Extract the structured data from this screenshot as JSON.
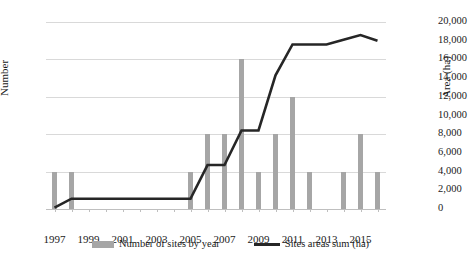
{
  "chart_data": {
    "type": "bar",
    "title": "",
    "subtitle": "",
    "xlabel": "",
    "ylabel": "Number",
    "y2label": "Area (ha)",
    "grid": true,
    "legend_position": "bottom",
    "categories": [
      1997,
      1998,
      1999,
      2000,
      2001,
      2002,
      2003,
      2004,
      2005,
      2006,
      2007,
      2008,
      2009,
      2010,
      2011,
      2012,
      2013,
      2014,
      2015,
      2016
    ],
    "xtick_labels": [
      "1997",
      "1999",
      "2001",
      "2003",
      "2005",
      "2007",
      "2009",
      "2011",
      "2013",
      "2015"
    ],
    "xtick_values": [
      1997,
      1999,
      2001,
      2003,
      2005,
      2007,
      2009,
      2011,
      2013,
      2015
    ],
    "ylim": [
      0,
      5
    ],
    "ytick_labels": [
      "0",
      "1",
      "2",
      "3",
      "4",
      "5"
    ],
    "ytick_values": [
      0,
      1,
      2,
      3,
      4,
      5
    ],
    "y2lim": [
      0,
      20000
    ],
    "y2tick_labels": [
      "0",
      "2,000",
      "4,000",
      "6,000",
      "8,000",
      "10,000",
      "12,000",
      "14,000",
      "16,000",
      "18,000",
      "20,000"
    ],
    "y2tick_values": [
      0,
      2000,
      4000,
      6000,
      8000,
      10000,
      12000,
      14000,
      16000,
      18000,
      20000
    ],
    "series": [
      {
        "name": "Number of sites by year",
        "kind": "bar",
        "axis": "left",
        "color": "#a6a6a6",
        "values": [
          1,
          1,
          0,
          0,
          0,
          0,
          0,
          0,
          1,
          2,
          2,
          4,
          1,
          2,
          3,
          1,
          0,
          1,
          2,
          1
        ]
      },
      {
        "name": "Sites areas sum (ha)",
        "kind": "line",
        "axis": "right",
        "color": "#262626",
        "values": [
          150,
          1100,
          1100,
          1100,
          1100,
          1100,
          1100,
          1100,
          1100,
          4700,
          4700,
          8400,
          8400,
          14300,
          17600,
          17600,
          17600,
          18100,
          18600,
          18000
        ]
      }
    ]
  },
  "legend": {
    "items": [
      {
        "label": "Number of sites by year",
        "swatch": "bar-swatch",
        "color": "#a6a6a6"
      },
      {
        "label": "Sites areas sum (ha)",
        "swatch": "line-swatch",
        "color": "#262626"
      }
    ]
  },
  "colors": {
    "bar": "#a6a6a6",
    "line": "#262626",
    "grid": "#d9d9d9",
    "axis": "#bfbfbf",
    "text": "#1a1a1a",
    "background": "#ffffff"
  }
}
